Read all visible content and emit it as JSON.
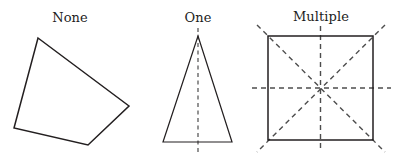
{
  "figure": {
    "width": 398,
    "height": 160,
    "background_color": "#ffffff",
    "outline_color": "#231f20",
    "symmetry_line_color": "#4d4d4d",
    "label_color": "#1c1c1c"
  },
  "panels": [
    {
      "label": "None",
      "shape": "irregular-quadrilateral",
      "symmetry_line_count": 0,
      "symmetry_line_labels": [],
      "vertices": "38,38 129,106 88,145 14,128",
      "lines": []
    },
    {
      "label": "One",
      "shape": "isosceles-triangle",
      "symmetry_line_count": 1,
      "symmetry_line_labels": [
        "vertical"
      ],
      "vertices": "198,36 232,142 163,142",
      "lines": [
        {
          "name": "vertical",
          "x1": 198,
          "y1": 28,
          "x2": 198,
          "y2": 152
        }
      ]
    },
    {
      "label": "Multiple",
      "shape": "square",
      "symmetry_line_count": 4,
      "symmetry_line_labels": [
        "vertical",
        "horizontal",
        "diagonal-tlbr",
        "diagonal-trbl"
      ],
      "vertices": "268,36 373,36 373,140 268,140",
      "lines": [
        {
          "name": "vertical",
          "x1": 320.5,
          "y1": 26,
          "x2": 320.5,
          "y2": 152
        },
        {
          "name": "horizontal",
          "x1": 252,
          "y1": 88,
          "x2": 391,
          "y2": 88
        },
        {
          "name": "diagonal-tlbr",
          "x1": 257,
          "y1": 25,
          "x2": 385,
          "y2": 152
        },
        {
          "name": "diagonal-trbl",
          "x1": 385,
          "y1": 25,
          "x2": 257,
          "y2": 152
        }
      ]
    }
  ]
}
